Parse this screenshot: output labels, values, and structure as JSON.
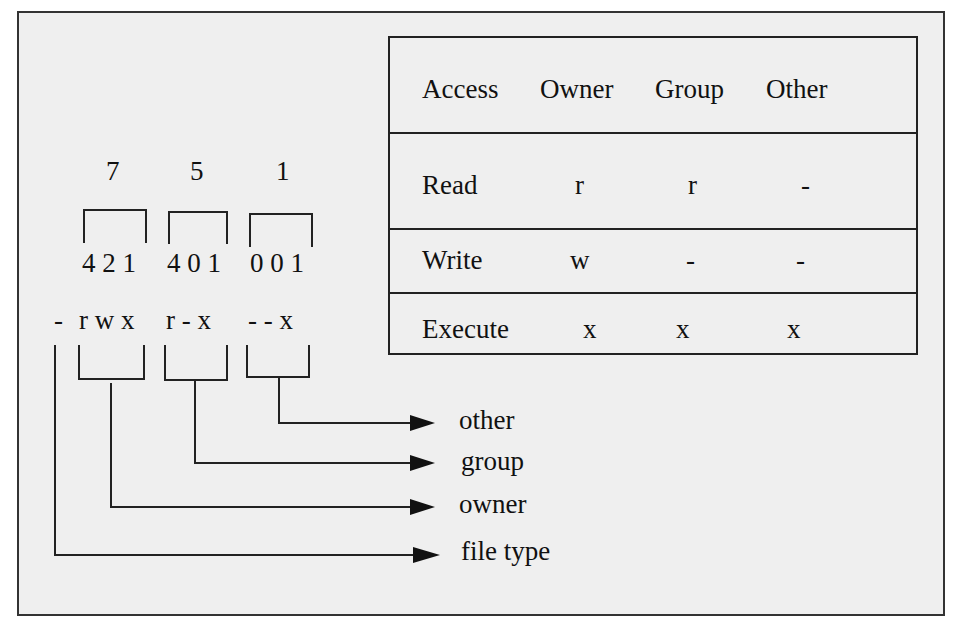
{
  "octal": {
    "digits": [
      "7",
      "5",
      "1"
    ],
    "bits": [
      "4 2 1",
      "4 0 1",
      "0 0 1"
    ]
  },
  "permission_string": {
    "file_type": "-",
    "owner": "r w x",
    "group": "r -  x",
    "other": "-  -  x"
  },
  "table": {
    "headers": [
      "Access",
      "Owner",
      "Group",
      "Other"
    ],
    "rows": [
      {
        "access": "Read",
        "owner": "r",
        "group": "r",
        "other": "-"
      },
      {
        "access": "Write",
        "owner": "w",
        "group": "-",
        "other": "-"
      },
      {
        "access": "Execute",
        "owner": "x",
        "group": "x",
        "other": "x"
      }
    ]
  },
  "labels": {
    "other": "other",
    "group": "group",
    "owner": "owner",
    "file_type": "file type"
  }
}
